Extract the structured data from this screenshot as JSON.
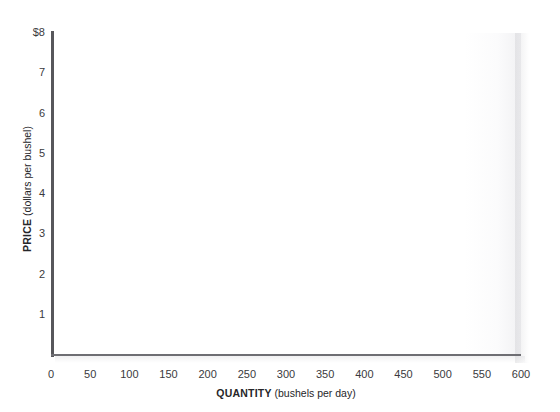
{
  "chart_data": {
    "type": "line",
    "title": "",
    "subtitle": "",
    "xlabel_bold": "QUANTITY",
    "xlabel_rest": " (bushels per day)",
    "ylabel_bold": "PRICE",
    "ylabel_rest": " (dollars per bushel)",
    "xlim": [
      0,
      600
    ],
    "ylim": [
      0,
      8
    ],
    "grid": false,
    "legend": null,
    "series": [],
    "annotations": [],
    "x_ticks": [
      {
        "value": 0,
        "label": "0"
      },
      {
        "value": 50,
        "label": "50"
      },
      {
        "value": 100,
        "label": "100"
      },
      {
        "value": 150,
        "label": "150"
      },
      {
        "value": 200,
        "label": "200"
      },
      {
        "value": 250,
        "label": "250"
      },
      {
        "value": 300,
        "label": "300"
      },
      {
        "value": 350,
        "label": "350"
      },
      {
        "value": 400,
        "label": "400"
      },
      {
        "value": 450,
        "label": "450"
      },
      {
        "value": 500,
        "label": "500"
      },
      {
        "value": 550,
        "label": "550"
      },
      {
        "value": 600,
        "label": "600"
      }
    ],
    "y_ticks": [
      {
        "value": 1,
        "label": "1"
      },
      {
        "value": 2,
        "label": "2"
      },
      {
        "value": 3,
        "label": "3"
      },
      {
        "value": 4,
        "label": "4"
      },
      {
        "value": 5,
        "label": "5"
      },
      {
        "value": 6,
        "label": "6"
      },
      {
        "value": 7,
        "label": "7"
      },
      {
        "value": 8,
        "label": "$8"
      }
    ],
    "colors": {
      "y_axis_line": "#57575b",
      "x_axis_line": "#6e6e73",
      "tick_text": "#3a3a3d",
      "axis_title_text": "#262629",
      "plot_background": "#ffffff",
      "page_background": "#ffffff"
    }
  },
  "cropped_text_remnant": ""
}
